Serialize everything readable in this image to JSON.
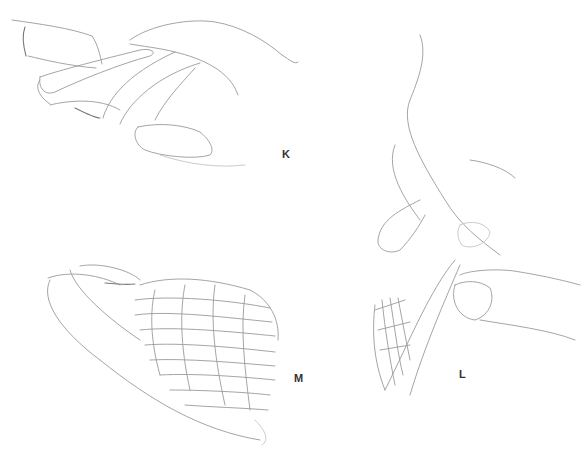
{
  "illustration": {
    "panels": [
      {
        "id": "K",
        "label": "K",
        "subject": "hands holding folded wing, top view"
      },
      {
        "id": "L",
        "label": "L",
        "subject": "hand pinching wing edge, side view"
      },
      {
        "id": "M",
        "label": "M",
        "subject": "folded bird wing with covert feathers"
      }
    ],
    "colors": {
      "background": "#ffffff",
      "pencil": "#9a9a9a",
      "label": "#333333"
    }
  }
}
